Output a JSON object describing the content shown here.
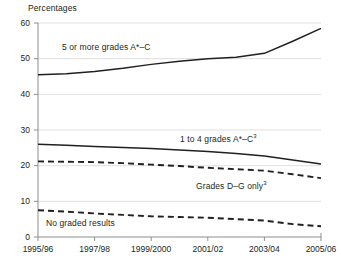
{
  "chart_data": {
    "type": "line",
    "title": "",
    "ylabel": "Percentages",
    "xlabel": "",
    "grid": true,
    "legend_position": "inline-annotations",
    "ylim": [
      0,
      60
    ],
    "yticks": [
      0,
      10,
      20,
      30,
      40,
      50,
      60
    ],
    "ytick_labels": [
      "0",
      "10",
      "20",
      "30",
      "40",
      "50",
      "60"
    ],
    "categories": [
      "1995/96",
      "1996/97",
      "1997/98",
      "1998/99",
      "1999/2000",
      "2000/01",
      "2001/02",
      "2002/03",
      "2003/04",
      "2004/05",
      "2005/06"
    ],
    "xtick_labels": [
      "1995/96",
      "1997/98",
      "1999/2000",
      "2001/02",
      "2003/04",
      "2005/06"
    ],
    "series": [
      {
        "name": "5 or more grades A*–C",
        "style": "solid",
        "color": "#231f20",
        "values": [
          45.5,
          45.8,
          46.4,
          47.3,
          48.4,
          49.3,
          50.0,
          50.4,
          51.5,
          54.9,
          58.5
        ]
      },
      {
        "name": "1 to 4 grades A*–C",
        "footnote": "3",
        "style": "solid",
        "color": "#231f20",
        "values": [
          26.0,
          25.7,
          25.4,
          25.1,
          24.8,
          24.4,
          24.0,
          23.4,
          22.7,
          21.6,
          20.5
        ]
      },
      {
        "name": "Grades D–G only",
        "footnote": "3",
        "style": "dashed",
        "color": "#231f20",
        "values": [
          21.2,
          21.1,
          21.0,
          20.7,
          20.3,
          19.9,
          19.4,
          19.0,
          18.6,
          17.6,
          16.5
        ]
      },
      {
        "name": "No graded results",
        "style": "dashed",
        "color": "#231f20",
        "values": [
          7.5,
          7.1,
          6.6,
          6.2,
          5.8,
          5.6,
          5.4,
          5.0,
          4.6,
          3.6,
          3.0
        ]
      }
    ],
    "annotations": [
      {
        "id": "label-5-or-more",
        "text": "5 or more grades A*–C",
        "footnote": "",
        "x": 62,
        "y": 42
      },
      {
        "id": "label-1-to-4",
        "text": "1 to 4 grades A*–C",
        "footnote": "3",
        "x": 180,
        "y": 134
      },
      {
        "id": "label-grades-dg",
        "text": "Grades D–G only",
        "footnote": "3",
        "x": 196,
        "y": 181
      },
      {
        "id": "label-no-graded",
        "text": "No graded results",
        "footnote": "",
        "x": 46,
        "y": 218
      }
    ]
  }
}
